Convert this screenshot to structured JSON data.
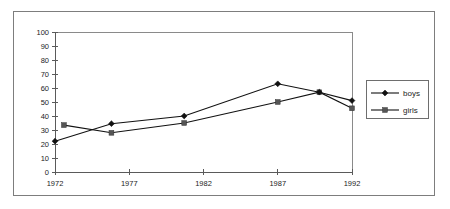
{
  "chart_data": {
    "type": "line",
    "title": "",
    "xlabel": "",
    "ylabel": "",
    "x": [
      1972,
      1977,
      1982,
      1987,
      1992
    ],
    "xticklabels": [
      "1972",
      "1977",
      "1982",
      "1987",
      "1992"
    ],
    "yticklabels": [
      "0",
      "10",
      "20",
      "30",
      "40",
      "50",
      "60",
      "70",
      "80",
      "90",
      "100"
    ],
    "ylim": [
      0,
      100
    ],
    "xlim": [
      1972,
      1992
    ],
    "ytick_step": 10,
    "grid": false,
    "legend_position": "right",
    "series": [
      {
        "name": "boys",
        "marker": "diamond",
        "color": "#111111",
        "points": [
          {
            "x": 1972.0,
            "y": 22
          },
          {
            "x": 1975.8,
            "y": 34.5
          },
          {
            "x": 1980.7,
            "y": 40
          },
          {
            "x": 1987.0,
            "y": 63
          },
          {
            "x": 1989.8,
            "y": 57
          },
          {
            "x": 1992.0,
            "y": 51
          }
        ]
      },
      {
        "name": "girls",
        "marker": "square",
        "color": "#555555",
        "points": [
          {
            "x": 1972.6,
            "y": 33.5
          },
          {
            "x": 1975.8,
            "y": 28
          },
          {
            "x": 1980.7,
            "y": 35
          },
          {
            "x": 1987.0,
            "y": 50
          },
          {
            "x": 1989.8,
            "y": 57
          },
          {
            "x": 1992.0,
            "y": 45.5
          }
        ]
      }
    ]
  },
  "legend": {
    "entries": [
      {
        "label": "boys",
        "marker": "diamond-marker-icon"
      },
      {
        "label": "girls",
        "marker": "square-marker-icon"
      }
    ]
  },
  "colors": {
    "frame": "#7d7d7d",
    "axis": "#5a5a5a",
    "plot_border": "#8a8a8a",
    "boys_line": "#111111",
    "girls_line": "#555555",
    "text": "#1c1c1c",
    "background": "#ffffff"
  }
}
